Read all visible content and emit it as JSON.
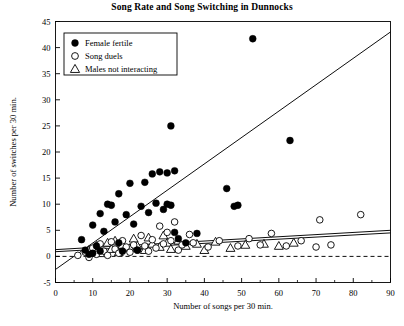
{
  "chart_data": {
    "type": "scatter",
    "title": "Song Rate and Song Switching in Dunnocks",
    "xlabel": "Number of songs per 30 min.",
    "ylabel": "Number of switches per 30 min.",
    "xlim": [
      0,
      90
    ],
    "ylim": [
      -5,
      45
    ],
    "xticks": [
      0,
      10,
      20,
      30,
      40,
      50,
      60,
      70,
      80,
      90
    ],
    "yticks": [
      -5,
      0,
      5,
      10,
      15,
      20,
      25,
      30,
      35,
      40,
      45
    ],
    "xtick_labels": [
      "0",
      "10",
      "20",
      "30",
      "40",
      "50",
      "60",
      "70",
      "80",
      "90"
    ],
    "ytick_labels": [
      "-5",
      "0",
      "5",
      "10",
      "15",
      "20",
      "25",
      "30",
      "35",
      "40",
      "45"
    ],
    "xminor_step": 5,
    "grid": false,
    "legend_position": "upper-left",
    "series": [
      {
        "name": "Female fertile",
        "marker": "filled-circle",
        "color": "#000000",
        "points": [
          [
            7,
            3.2
          ],
          [
            8,
            1.2
          ],
          [
            9,
            0.4
          ],
          [
            10,
            6.0
          ],
          [
            10,
            0.6
          ],
          [
            11,
            2.0
          ],
          [
            12,
            8.2
          ],
          [
            12,
            1.0
          ],
          [
            13,
            4.8
          ],
          [
            14,
            10.0
          ],
          [
            15,
            9.8
          ],
          [
            16,
            6.6
          ],
          [
            17,
            12.0
          ],
          [
            17,
            2.6
          ],
          [
            18,
            1.0
          ],
          [
            19,
            8.0
          ],
          [
            20,
            14.0
          ],
          [
            21,
            6.2
          ],
          [
            22,
            1.2
          ],
          [
            23,
            9.6
          ],
          [
            24,
            14.2
          ],
          [
            25,
            8.4
          ],
          [
            26,
            15.8
          ],
          [
            27,
            10.2
          ],
          [
            28,
            16.2
          ],
          [
            29,
            9.0
          ],
          [
            30,
            16.0
          ],
          [
            30,
            10.0
          ],
          [
            31,
            25.0
          ],
          [
            31,
            9.8
          ],
          [
            32,
            16.4
          ],
          [
            32,
            4.6
          ],
          [
            33,
            3.4
          ],
          [
            35,
            2.6
          ],
          [
            38,
            4.4
          ],
          [
            46,
            13.0
          ],
          [
            48,
            9.6
          ],
          [
            49,
            9.8
          ],
          [
            53,
            41.7
          ],
          [
            63,
            22.2
          ]
        ]
      },
      {
        "name": "Song duels",
        "marker": "open-circle",
        "color": "#000000",
        "points": [
          [
            6,
            0.2
          ],
          [
            8,
            0.8
          ],
          [
            9,
            -0.2
          ],
          [
            10,
            1.6
          ],
          [
            11,
            0.4
          ],
          [
            12,
            2.4
          ],
          [
            13,
            1.0
          ],
          [
            14,
            0.2
          ],
          [
            15,
            2.8
          ],
          [
            16,
            1.4
          ],
          [
            17,
            0.6
          ],
          [
            18,
            3.0
          ],
          [
            19,
            1.8
          ],
          [
            20,
            0.8
          ],
          [
            21,
            2.2
          ],
          [
            22,
            1.2
          ],
          [
            23,
            4.0
          ],
          [
            24,
            2.0
          ],
          [
            25,
            1.0
          ],
          [
            26,
            3.2
          ],
          [
            27,
            1.6
          ],
          [
            28,
            5.8
          ],
          [
            29,
            2.4
          ],
          [
            30,
            4.6
          ],
          [
            31,
            3.0
          ],
          [
            32,
            6.6
          ],
          [
            33,
            1.2
          ],
          [
            34,
            2.2
          ],
          [
            36,
            4.2
          ],
          [
            37,
            2.6
          ],
          [
            41,
            1.8
          ],
          [
            44,
            3.0
          ],
          [
            49,
            2.0
          ],
          [
            52,
            3.4
          ],
          [
            55,
            2.2
          ],
          [
            58,
            4.4
          ],
          [
            62,
            2.0
          ],
          [
            66,
            3.0
          ],
          [
            70,
            1.8
          ],
          [
            71,
            7.0
          ],
          [
            74,
            2.2
          ],
          [
            82,
            8.0
          ]
        ]
      },
      {
        "name": "Males not interacting",
        "marker": "triangle",
        "color": "#000000",
        "points": [
          [
            9,
            1.2
          ],
          [
            11,
            2.0
          ],
          [
            12,
            0.6
          ],
          [
            14,
            2.6
          ],
          [
            15,
            1.4
          ],
          [
            16,
            3.0
          ],
          [
            17,
            0.8
          ],
          [
            18,
            2.2
          ],
          [
            20,
            1.6
          ],
          [
            21,
            3.4
          ],
          [
            22,
            2.0
          ],
          [
            24,
            1.2
          ],
          [
            25,
            3.6
          ],
          [
            26,
            2.4
          ],
          [
            28,
            1.8
          ],
          [
            29,
            4.0
          ],
          [
            30,
            2.6
          ],
          [
            31,
            1.4
          ],
          [
            33,
            3.0
          ],
          [
            35,
            2.0
          ],
          [
            38,
            2.4
          ],
          [
            40,
            1.2
          ],
          [
            43,
            2.8
          ],
          [
            47,
            1.6
          ],
          [
            51,
            2.2
          ],
          [
            56,
            2.4
          ],
          [
            60,
            2.0
          ],
          [
            64,
            2.6
          ]
        ]
      }
    ],
    "lines": [
      {
        "name": "fertile-regression",
        "style": "solid",
        "from": [
          0,
          -2.5
        ],
        "to": [
          90,
          43.0
        ]
      },
      {
        "name": "duels-regression",
        "style": "solid",
        "from": [
          0,
          1.3
        ],
        "to": [
          90,
          5.0
        ]
      },
      {
        "name": "not-interacting-regression",
        "style": "solid",
        "from": [
          0,
          0.9
        ],
        "to": [
          90,
          4.5
        ]
      },
      {
        "name": "zero-reference",
        "style": "dashed",
        "from": [
          0,
          0
        ],
        "to": [
          90,
          0
        ]
      }
    ],
    "legend": [
      {
        "label": "Female fertile",
        "marker": "filled-circle"
      },
      {
        "label": "Song duels",
        "marker": "open-circle"
      },
      {
        "label": "Males not interacting",
        "marker": "triangle"
      }
    ]
  }
}
